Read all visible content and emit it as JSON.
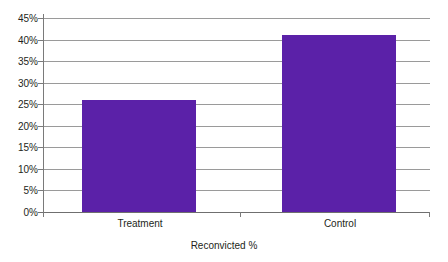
{
  "chart_data": {
    "type": "bar",
    "title": "",
    "subtitle": "",
    "categories": [
      "Treatment",
      "Control"
    ],
    "values": [
      26,
      41
    ],
    "series": [
      {
        "name": "Reconvicted %",
        "values": [
          26,
          41
        ]
      }
    ],
    "xlabel": "Reconvicted %",
    "ylabel": "",
    "ylim": [
      0,
      45
    ],
    "ytick_labels": [
      "0%",
      "5%",
      "10%",
      "15%",
      "20%",
      "25%",
      "30%",
      "35%",
      "40%",
      "45%"
    ],
    "ytick_values": [
      0,
      5,
      10,
      15,
      20,
      25,
      30,
      35,
      40,
      45
    ],
    "grid": true,
    "legend": false,
    "legend_position": "none",
    "bar_color": "#5b21a8",
    "gridline_color": "#9a9a9a",
    "axis_color": "#7a7a7a",
    "background": "#ffffff"
  }
}
